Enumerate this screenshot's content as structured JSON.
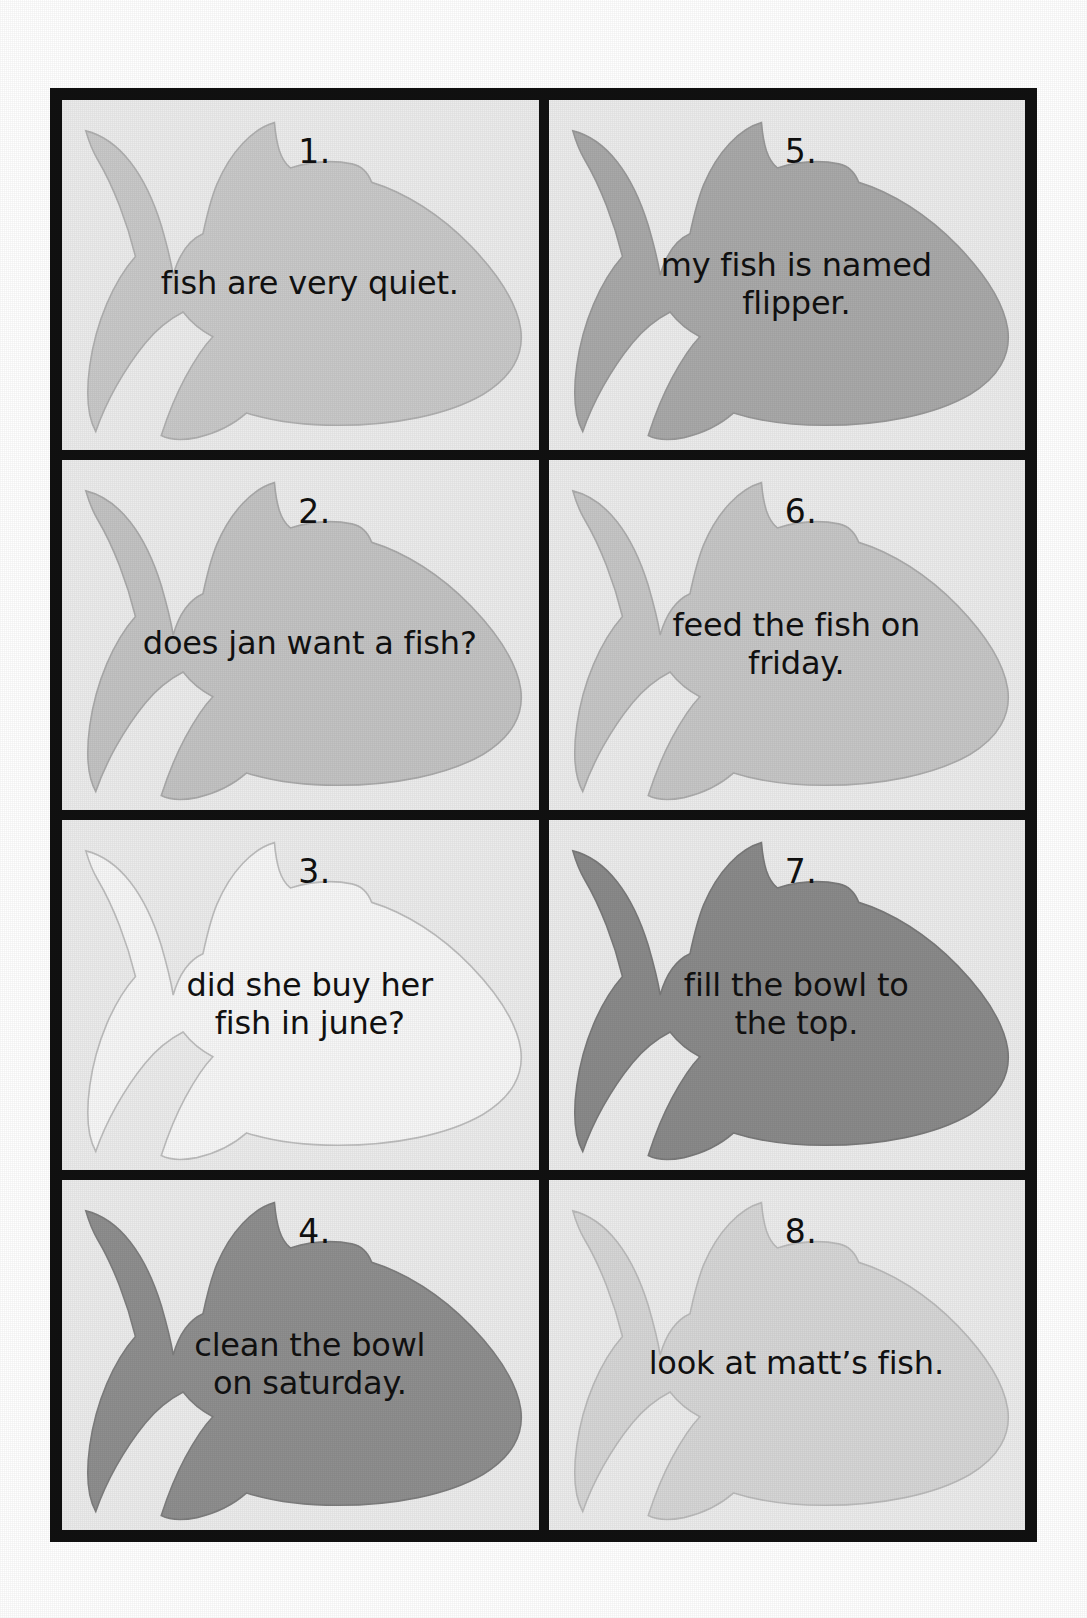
{
  "page": {
    "kind": "fish-sentence-cards-worksheet",
    "background_color": "#ffffff",
    "frame_color": "#111111",
    "card_background_color": "#ececec",
    "text_color": "#111111",
    "columns": 2,
    "rows": 4
  },
  "cards": [
    {
      "number": "1.",
      "sentence": "fish are very quiet.",
      "sentence_lines": [
        "fish are very quiet."
      ],
      "fish_fill": "#c9c9c9",
      "fish_stroke": "#b0b0b0",
      "column": 1,
      "row": 1
    },
    {
      "number": "2.",
      "sentence": "does jan want a fish?",
      "sentence_lines": [
        "does jan want a fish?"
      ],
      "fish_fill": "#c3c3c3",
      "fish_stroke": "#aaaaaa",
      "column": 1,
      "row": 2
    },
    {
      "number": "3.",
      "sentence": "did she buy her fish in june?",
      "sentence_lines": [
        "did she buy her",
        "fish in june?"
      ],
      "fish_fill": "#f7f7f7",
      "fish_stroke": "#bdbdbd",
      "column": 1,
      "row": 3
    },
    {
      "number": "4.",
      "sentence": "clean the bowl on saturday.",
      "sentence_lines": [
        "clean the bowl",
        "on saturday."
      ],
      "fish_fill": "#8f8f8f",
      "fish_stroke": "#7e7e7e",
      "column": 1,
      "row": 4
    },
    {
      "number": "5.",
      "sentence": "my fish is named flipper.",
      "sentence_lines": [
        "my fish is named",
        "flipper."
      ],
      "fish_fill": "#a9a9a9",
      "fish_stroke": "#999999",
      "column": 2,
      "row": 1
    },
    {
      "number": "6.",
      "sentence": "feed the fish on friday.",
      "sentence_lines": [
        "feed the fish on",
        "friday."
      ],
      "fish_fill": "#c6c6c6",
      "fish_stroke": "#adadad",
      "column": 2,
      "row": 2
    },
    {
      "number": "7.",
      "sentence": "fill the bowl to the top.",
      "sentence_lines": [
        "fill the bowl to",
        "the top."
      ],
      "fish_fill": "#8a8a8a",
      "fish_stroke": "#7a7a7a",
      "column": 2,
      "row": 3
    },
    {
      "number": "8.",
      "sentence": "look at matt's fish.",
      "sentence_lines": [
        "look at matt’s fish."
      ],
      "fish_fill": "#d6d6d6",
      "fish_stroke": "#bbbbbb",
      "column": 2,
      "row": 4
    }
  ]
}
